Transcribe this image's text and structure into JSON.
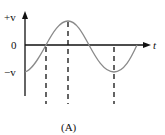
{
  "diagram": {
    "caption": "(A)",
    "y_axis": {
      "top_label": "+v",
      "zero_label": "0",
      "bottom_label": "−v"
    },
    "x_axis": {
      "label": "t"
    },
    "curve": {
      "type": "sine",
      "color": "#8a8a8a",
      "description": "Starts at -v, rises through 0 to +v peak, falls through 0 to -v trough, rises back to 0"
    },
    "dashed_markers": [
      "first zero crossing",
      "positive peak",
      "negative trough"
    ],
    "colors": {
      "axis": "#111111",
      "curve": "#8a8a8a",
      "dashes": "#111111"
    }
  }
}
